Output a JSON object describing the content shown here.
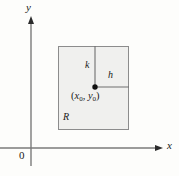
{
  "figure": {
    "background_color": "#fdfdfb",
    "axes": {
      "x_axis_label": "x",
      "y_axis_label": "y",
      "origin_label": "0",
      "axis_color": "#7a7a7a",
      "x_axis_y": 148,
      "y_axis_x": 31,
      "x_axis_start": 0,
      "x_axis_end": 162,
      "y_axis_top": 17,
      "y_axis_bottom": 166
    },
    "region": {
      "label": "R",
      "fill_color": "#f0f0ee",
      "border_color": "#8c8c8c",
      "left": 58,
      "top": 46,
      "right": 129,
      "bottom": 130
    },
    "point": {
      "label_x": "x",
      "label_x_sub": "0",
      "label_y": "y",
      "label_y_sub": "0",
      "label_open": "(",
      "label_comma": ", ",
      "label_close": ")",
      "marker_color": "#111111",
      "cx": 95,
      "cy": 87,
      "radius": 2.6
    },
    "segments": [
      {
        "name": "vertical-segment-k",
        "label": "k",
        "color": "#6f6f6f",
        "x1": 95,
        "y1": 46,
        "x2": 95,
        "y2": 87
      },
      {
        "name": "horizontal-segment-h",
        "label": "h",
        "color": "#6f6f6f",
        "x1": 95,
        "y1": 87,
        "x2": 129,
        "y2": 87
      }
    ]
  }
}
